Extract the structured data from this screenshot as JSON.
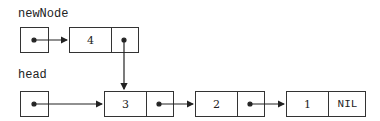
{
  "labels": {
    "new_node": "newNode",
    "head": "head"
  },
  "new_node_pointer": {
    "name": "newNode",
    "points_to": "4"
  },
  "head_pointer": {
    "name": "head",
    "points_to": "3"
  },
  "nodes": [
    {
      "value": "4",
      "next": "3"
    },
    {
      "value": "3",
      "next": "2"
    },
    {
      "value": "2",
      "next": "1"
    },
    {
      "value": "1",
      "next": "NIL"
    }
  ],
  "nil_label": "NIL"
}
